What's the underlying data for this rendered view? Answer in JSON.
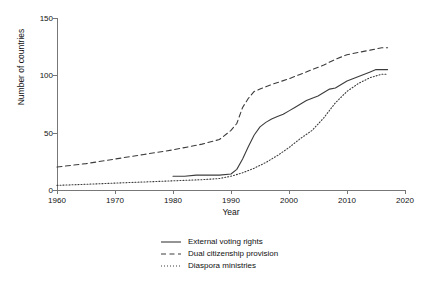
{
  "chart_data": {
    "type": "line",
    "title": "",
    "xlabel": "Year",
    "ylabel": "Number of countries",
    "xlim": [
      1960,
      2020
    ],
    "ylim": [
      0,
      150
    ],
    "xticks": [
      1960,
      1970,
      1980,
      1990,
      2000,
      2010,
      2020
    ],
    "yticks": [
      0,
      50,
      100,
      150
    ],
    "grid": false,
    "legend_position": "bottom-center",
    "series": [
      {
        "name": "External voting rights",
        "style": "solid",
        "color": "#3c3c3c",
        "x": [
          1980,
          1982,
          1984,
          1986,
          1988,
          1990,
          1991,
          1992,
          1993,
          1994,
          1995,
          1996,
          1997,
          1998,
          1999,
          2000,
          2001,
          2002,
          2003,
          2004,
          2005,
          2006,
          2007,
          2008,
          2009,
          2010,
          2011,
          2012,
          2013,
          2014,
          2015,
          2016,
          2017
        ],
        "values": [
          12,
          12,
          13,
          13,
          13,
          14,
          18,
          27,
          38,
          48,
          55,
          59,
          62,
          64,
          66,
          69,
          72,
          75,
          78,
          80,
          82,
          85,
          88,
          89,
          92,
          95,
          97,
          99,
          101,
          103,
          105,
          105,
          105
        ]
      },
      {
        "name": "Dual citizenship provision",
        "style": "dashed",
        "color": "#3c3c3c",
        "x": [
          1960,
          1965,
          1970,
          1975,
          1980,
          1985,
          1988,
          1990,
          1991,
          1992,
          1993,
          1994,
          1995,
          1997,
          2000,
          2002,
          2004,
          2006,
          2008,
          2010,
          2012,
          2014,
          2016,
          2017
        ],
        "values": [
          20,
          23,
          27,
          31,
          35,
          40,
          44,
          52,
          58,
          72,
          80,
          86,
          88,
          92,
          97,
          101,
          105,
          109,
          114,
          118,
          120,
          122,
          124,
          124
        ]
      },
      {
        "name": "Diaspora ministries",
        "style": "dotted",
        "color": "#3c3c3c",
        "x": [
          1960,
          1965,
          1970,
          1975,
          1980,
          1985,
          1988,
          1990,
          1992,
          1994,
          1996,
          1998,
          2000,
          2002,
          2004,
          2006,
          2008,
          2010,
          2012,
          2014,
          2016,
          2017
        ],
        "values": [
          4,
          5,
          6,
          7,
          8,
          9,
          10,
          12,
          15,
          19,
          24,
          30,
          37,
          45,
          52,
          63,
          76,
          86,
          93,
          98,
          101,
          101
        ]
      }
    ]
  },
  "axes": {
    "ylabel": "Number of countries",
    "xlabel": "Year",
    "ytick_labels": [
      "0",
      "50",
      "100",
      "150"
    ],
    "xtick_labels": [
      "1960",
      "1970",
      "1980",
      "1990",
      "2000",
      "2010",
      "2020"
    ]
  },
  "legend": {
    "entries": [
      {
        "label": "External voting rights",
        "style": "solid"
      },
      {
        "label": "Dual citizenship provision",
        "style": "dashed"
      },
      {
        "label": "Diaspora ministries",
        "style": "dotted"
      }
    ]
  }
}
